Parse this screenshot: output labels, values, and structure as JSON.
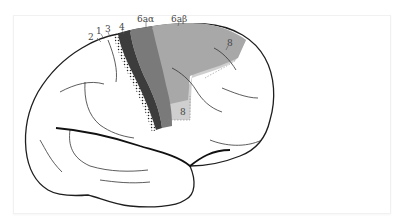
{
  "diagram": {
    "type": "brain-lateral-view",
    "labels": {
      "area2": "2",
      "area1": "1",
      "area3": "3",
      "area4": "4",
      "area6a_alpha": "6aα",
      "area6a_beta": "6aβ",
      "area8_upper": "8",
      "area8_lower": "8"
    },
    "colors": {
      "area4": "#3c3c3c",
      "area6a_alpha": "#7a7a7a",
      "area6a_beta": "#a8a8a8",
      "area8": "#cfcfcf",
      "outline": "#1e1e1e",
      "background": "#ffffff"
    }
  }
}
